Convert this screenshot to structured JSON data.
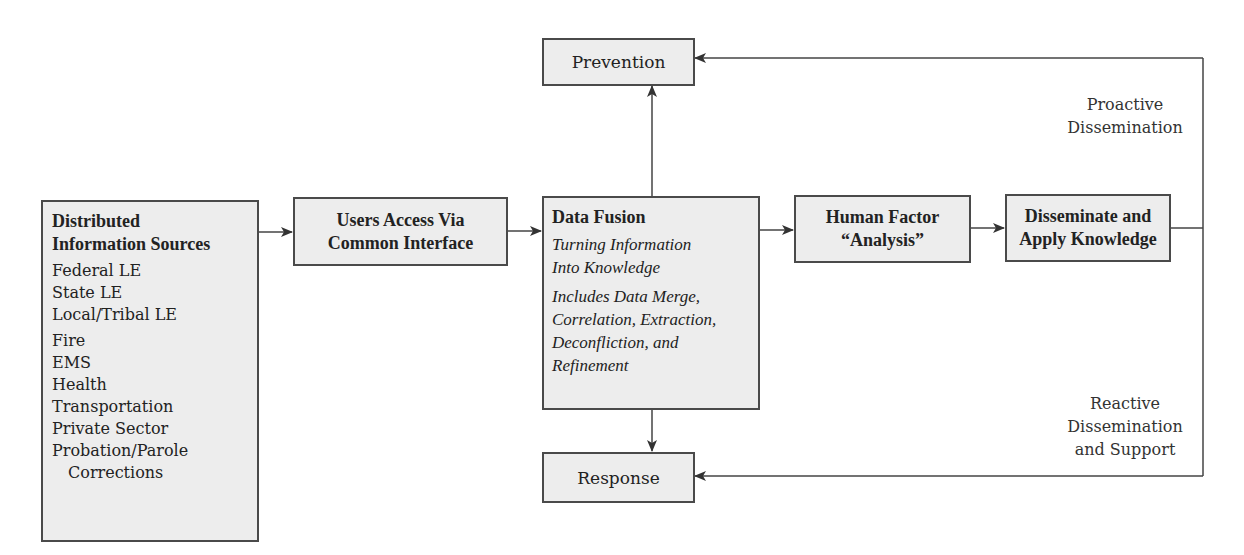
{
  "diagram": {
    "sources": {
      "title": [
        "Distributed",
        "Information Sources"
      ],
      "groups": [
        [
          "Federal LE",
          "State LE",
          "Local/Tribal LE"
        ],
        [
          "Fire",
          "EMS",
          "Health",
          "Transportation",
          "Private Sector",
          "Probation/Parole",
          "Corrections"
        ]
      ]
    },
    "users_access": {
      "lines": [
        "Users Access Via",
        "Common Interface"
      ]
    },
    "data_fusion": {
      "title": "Data Fusion",
      "subtitle": [
        "Turning Information",
        "Into Knowledge"
      ],
      "details": [
        "Includes Data Merge,",
        "Correlation, Extraction,",
        "Deconfliction, and",
        "Refinement"
      ]
    },
    "human_factor": {
      "lines": [
        "Human Factor",
        "“Analysis”"
      ]
    },
    "disseminate": {
      "lines": [
        "Disseminate and",
        "Apply Knowledge"
      ]
    },
    "prevention": {
      "label": "Prevention"
    },
    "response": {
      "label": "Response"
    },
    "proactive_label": [
      "Proactive",
      "Dissemination"
    ],
    "reactive_label": [
      "Reactive",
      "Dissemination",
      "and Support"
    ]
  },
  "colors": {
    "box_fill": "#ededed",
    "stroke": "#4a4a4a",
    "text": "#222222"
  }
}
